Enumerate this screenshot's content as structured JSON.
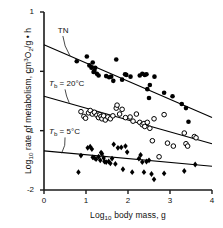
{
  "chart_data": {
    "type": "scatter",
    "title": "",
    "xlabel": "Log10 body mass, g",
    "ylabel": "Log10 rate of metabolism, cm3O2/g • h",
    "xlim": [
      0,
      4
    ],
    "ylim": [
      -2,
      1
    ],
    "xticks": [
      "0",
      "1",
      "2",
      "3",
      "4"
    ],
    "yticks": [
      "1",
      "0",
      "-1",
      "-2"
    ],
    "grid": false,
    "legend": "none",
    "annotations": [
      {
        "id": "tn",
        "text": "TN",
        "x": 0.33,
        "y": 0.68
      },
      {
        "id": "tb20",
        "text": "Tb = 20°C",
        "x": 0.12,
        "y": -0.22
      },
      {
        "id": "tb5",
        "text": "Tb = 5°C",
        "x": 0.12,
        "y": -1.03
      }
    ],
    "series": [
      {
        "name": "TN",
        "marker": "filled-circle",
        "color": "#000000",
        "fit_line": {
          "x0": 0.0,
          "y0": 0.45,
          "x1": 4.0,
          "y1": -0.78
        },
        "points": [
          [
            0.78,
            0.17
          ],
          [
            1.02,
            0.25
          ],
          [
            1.08,
            0.1
          ],
          [
            1.13,
            0.06
          ],
          [
            1.16,
            0.15
          ],
          [
            1.18,
            -0.01
          ],
          [
            1.2,
            0.01
          ],
          [
            1.22,
            0.06
          ],
          [
            1.26,
            -0.04
          ],
          [
            1.3,
            -0.07
          ],
          [
            1.48,
            -0.08
          ],
          [
            1.55,
            -0.1
          ],
          [
            1.6,
            -0.09
          ],
          [
            1.65,
            -0.16
          ],
          [
            1.72,
            0.2
          ],
          [
            1.86,
            -0.14
          ],
          [
            1.93,
            -0.05
          ],
          [
            1.96,
            -0.06
          ],
          [
            2.06,
            -0.09
          ],
          [
            2.28,
            -0.07
          ],
          [
            2.34,
            -0.04
          ],
          [
            2.4,
            -0.06
          ],
          [
            2.44,
            -0.05
          ],
          [
            2.46,
            -0.3
          ],
          [
            2.5,
            -0.45
          ],
          [
            2.52,
            -0.23
          ],
          [
            2.63,
            -0.09
          ],
          [
            2.86,
            -0.36
          ],
          [
            3.06,
            -0.42
          ],
          [
            3.28,
            -0.55
          ],
          [
            3.38,
            -0.62
          ],
          [
            3.44,
            -0.85
          ]
        ]
      },
      {
        "name": "Tb = 20°C",
        "marker": "open-circle",
        "color": "#000000",
        "fit_line": {
          "x0": 0.0,
          "y0": -0.42,
          "x1": 4.0,
          "y1": -1.22
        },
        "points": [
          [
            0.88,
            -0.68
          ],
          [
            0.95,
            -0.76
          ],
          [
            0.99,
            -0.79
          ],
          [
            1.06,
            -0.7
          ],
          [
            1.1,
            -0.66
          ],
          [
            1.15,
            -0.72
          ],
          [
            1.2,
            -0.69
          ],
          [
            1.26,
            -0.74
          ],
          [
            1.3,
            -0.78
          ],
          [
            1.33,
            -0.73
          ],
          [
            1.36,
            -0.76
          ],
          [
            1.38,
            -0.8
          ],
          [
            1.42,
            -0.75
          ],
          [
            1.46,
            -0.82
          ],
          [
            1.52,
            -0.77
          ],
          [
            1.58,
            -0.8
          ],
          [
            1.64,
            -0.75
          ],
          [
            1.72,
            -0.62
          ],
          [
            1.74,
            -0.57
          ],
          [
            1.8,
            -0.72
          ],
          [
            1.86,
            -0.64
          ],
          [
            1.94,
            -0.78
          ],
          [
            2.05,
            -0.77
          ],
          [
            2.12,
            -0.84
          ],
          [
            2.2,
            -0.72
          ],
          [
            2.28,
            -0.86
          ],
          [
            2.34,
            -0.9
          ],
          [
            2.38,
            -0.88
          ],
          [
            2.4,
            -0.93
          ],
          [
            2.46,
            -0.86
          ],
          [
            2.52,
            -0.96
          ],
          [
            2.58,
            -1.17
          ],
          [
            2.62,
            -0.8
          ],
          [
            2.74,
            -1.44
          ],
          [
            2.86,
            -0.73
          ],
          [
            2.94,
            -1.21
          ],
          [
            3.08,
            -1.26
          ],
          [
            3.34,
            -1.04
          ],
          [
            3.38,
            -1.22
          ],
          [
            3.42,
            -1.26
          ],
          [
            3.58,
            -1.1
          ],
          [
            3.62,
            -1.12
          ]
        ]
      },
      {
        "name": "Tb = 5°C",
        "marker": "filled-diamond",
        "color": "#000000",
        "fit_line": {
          "x0": 0.0,
          "y0": -1.34,
          "x1": 4.0,
          "y1": -1.6
        },
        "points": [
          [
            0.82,
            -1.7
          ],
          [
            0.88,
            -1.42
          ],
          [
            1.04,
            -1.29
          ],
          [
            1.1,
            -1.27
          ],
          [
            1.14,
            -1.31
          ],
          [
            1.16,
            -1.45
          ],
          [
            1.2,
            -1.46
          ],
          [
            1.24,
            -1.48
          ],
          [
            1.3,
            -1.44
          ],
          [
            1.34,
            -1.5
          ],
          [
            1.36,
            -1.37
          ],
          [
            1.38,
            -1.39
          ],
          [
            1.42,
            -1.46
          ],
          [
            1.44,
            -1.52
          ],
          [
            1.48,
            -1.53
          ],
          [
            1.54,
            -1.52
          ],
          [
            1.58,
            -1.55
          ],
          [
            1.62,
            -1.47
          ],
          [
            1.66,
            -1.23
          ],
          [
            1.7,
            -1.56
          ],
          [
            1.76,
            -1.29
          ],
          [
            1.84,
            -1.28
          ],
          [
            1.88,
            -1.65
          ],
          [
            1.94,
            -1.26
          ],
          [
            1.98,
            -1.36
          ],
          [
            2.1,
            -1.7
          ],
          [
            2.26,
            -1.47
          ],
          [
            2.3,
            -1.41
          ],
          [
            2.34,
            -1.53
          ],
          [
            2.38,
            -1.7
          ],
          [
            2.44,
            -1.52
          ],
          [
            2.5,
            -1.5
          ],
          [
            2.56,
            -1.73
          ],
          [
            2.62,
            -1.82
          ],
          [
            2.86,
            -1.72
          ],
          [
            3.34,
            -1.68
          ],
          [
            3.6,
            -1.57
          ]
        ]
      }
    ]
  },
  "figure": {
    "axis_color": "#1a1a1a",
    "background": "#ffffff",
    "x_axis_title": "Log10 body mass, g",
    "y_axis_title": "Log10 rate of metabolism, cm3O2/g • h"
  }
}
